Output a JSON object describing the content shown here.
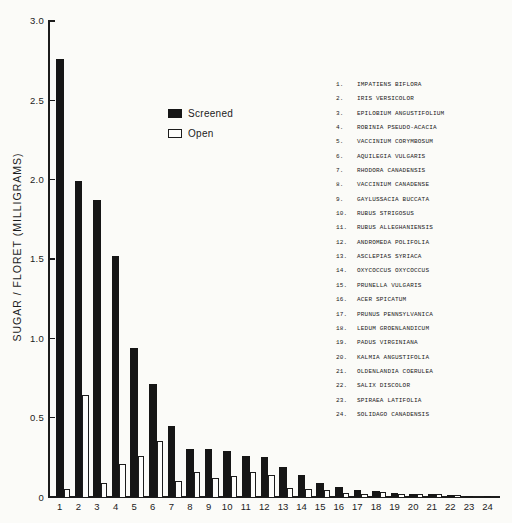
{
  "figure": {
    "background": "#fbfbf8",
    "ink": "#1c1c1c"
  },
  "legend": {
    "screened_label": "Screened",
    "open_label": "Open"
  },
  "y_axis": {
    "title": "SUGAR / FLORET (MILLIGRAMS)",
    "tick_labels": [
      "3.0",
      "2.5",
      "2.0",
      "1.5",
      "1.0",
      "0.5",
      "0"
    ]
  },
  "species_list": [
    {
      "num": "1.",
      "name": "IMPATIENS BIFLORA"
    },
    {
      "num": "2.",
      "name": "IRIS VERSICOLOR"
    },
    {
      "num": "3.",
      "name": "EPILOBIUM ANGUSTIFOLIUM"
    },
    {
      "num": "4.",
      "name": "ROBINIA PSEUDO-ACACIA"
    },
    {
      "num": "5.",
      "name": "VACCINIUM CORYMBOSUM"
    },
    {
      "num": "6.",
      "name": "AQUILEGIA VULGARIS"
    },
    {
      "num": "7.",
      "name": "RHODORA CANADENSIS"
    },
    {
      "num": "8.",
      "name": "VACCINIUM CANADENSE"
    },
    {
      "num": "9.",
      "name": "GAYLUSSACIA BUCCATA"
    },
    {
      "num": "10.",
      "name": "RUBUS STRIGOSUS"
    },
    {
      "num": "11.",
      "name": "RUBUS ALLEGHANIENSIS"
    },
    {
      "num": "12.",
      "name": "ANDROMEDA POLIFOLIA"
    },
    {
      "num": "13.",
      "name": "ASCLEPIAS SYRIACA"
    },
    {
      "num": "14.",
      "name": "OXYCOCCUS OXYCOCCUS"
    },
    {
      "num": "15.",
      "name": "PRUNELLA VULGARIS"
    },
    {
      "num": "16.",
      "name": "ACER SPICATUM"
    },
    {
      "num": "17.",
      "name": "PRUNUS PENNSYLVANICA"
    },
    {
      "num": "18.",
      "name": "LEDUM GROENLANDICUM"
    },
    {
      "num": "19.",
      "name": "PADUS VIRGINIANA"
    },
    {
      "num": "20.",
      "name": "KALMIA ANGUSTIFOLIA"
    },
    {
      "num": "21.",
      "name": "OLDENLANDIA COERULEA"
    },
    {
      "num": "22.",
      "name": "SALIX DISCOLOR"
    },
    {
      "num": "23.",
      "name": "SPIRAEA LATIFOLIA"
    },
    {
      "num": "24.",
      "name": "SOLIDAGO CANADENSIS"
    }
  ],
  "chart_data": {
    "type": "bar",
    "title": "",
    "xlabel": "",
    "ylabel": "SUGAR / FLORET (MILLIGRAMS)",
    "ylim": [
      0,
      3.0
    ],
    "ytick_step": 0.5,
    "grid": false,
    "legend_position": "upper-left-inside",
    "categories": [
      "1",
      "2",
      "3",
      "4",
      "5",
      "6",
      "7",
      "8",
      "9",
      "10",
      "11",
      "12",
      "13",
      "14",
      "15",
      "16",
      "17",
      "18",
      "19",
      "20",
      "21",
      "22",
      "23",
      "24"
    ],
    "series": [
      {
        "name": "Screened",
        "style": "solid-black",
        "values": [
          2.76,
          1.99,
          1.87,
          1.52,
          0.94,
          0.71,
          0.45,
          0.3,
          0.3,
          0.29,
          0.26,
          0.25,
          0.19,
          0.14,
          0.09,
          0.065,
          0.045,
          0.035,
          0.025,
          0.022,
          0.022,
          0.015,
          0.008,
          0.006
        ]
      },
      {
        "name": "Open",
        "style": "white-outlined",
        "values": [
          0.05,
          0.64,
          0.09,
          0.21,
          0.26,
          0.35,
          0.1,
          0.16,
          0.12,
          0.13,
          0.155,
          0.14,
          0.055,
          0.05,
          0.045,
          0.025,
          0.02,
          0.03,
          0.02,
          0.018,
          0.018,
          0.012,
          0.006,
          0.004
        ]
      }
    ]
  }
}
